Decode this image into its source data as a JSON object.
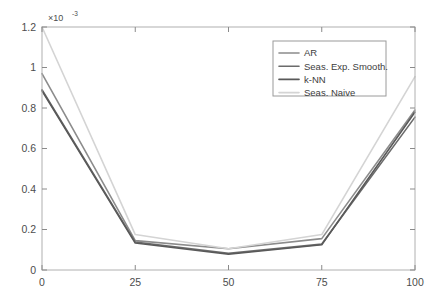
{
  "chart_data": {
    "type": "line",
    "title": "",
    "xlabel": "",
    "ylabel": "",
    "y_multiplier": "×10",
    "y_multiplier_exponent": "-3",
    "x": [
      0,
      25,
      50,
      75,
      100
    ],
    "xlim": [
      0,
      100
    ],
    "ylim": [
      0,
      1.2
    ],
    "xticks": [
      "0",
      "25",
      "50",
      "75",
      "100"
    ],
    "yticks": [
      "0",
      "0.2",
      "0.4",
      "0.6",
      "0.8",
      "1",
      "1.2"
    ],
    "grid": false,
    "legend_position": "top-right",
    "series": [
      {
        "name": "AR",
        "color": "#8c8c8c",
        "values": [
          0.97,
          0.145,
          0.105,
          0.155,
          0.79
        ]
      },
      {
        "name": "Seas. Exp. Smooth.",
        "color": "#6b6b6b",
        "values": [
          0.89,
          0.138,
          0.082,
          0.128,
          0.755
        ]
      },
      {
        "name": "k-NN",
        "color": "#595959",
        "values": [
          0.885,
          0.133,
          0.078,
          0.125,
          0.78
        ]
      },
      {
        "name": "Seas. Naive",
        "color": "#d4d4d4",
        "values": [
          1.2,
          0.175,
          0.105,
          0.175,
          0.955
        ]
      }
    ]
  },
  "axes": {
    "frame_color": "#b0b0b0",
    "tick_color": "#8a8a8a",
    "background": "#ffffff"
  },
  "legend": {
    "border_color": "#9a9a9a",
    "background": "#ffffff",
    "entries": [
      {
        "label": "AR"
      },
      {
        "label": "Seas. Exp. Smooth."
      },
      {
        "label": "k-NN"
      },
      {
        "label": "Seas. Naive"
      }
    ]
  }
}
